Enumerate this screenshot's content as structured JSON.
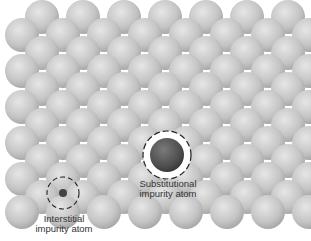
{
  "diagram": {
    "type": "crystal-lattice-point-defects",
    "host_atom_color": "#c9c9c9",
    "impurity_atom_color": "#5a5a5a",
    "background": "#ffffff",
    "rows": [
      {
        "y": 17,
        "x0": 42
      },
      {
        "y": 35,
        "x0": 22
      },
      {
        "y": 53,
        "x0": 42
      },
      {
        "y": 71,
        "x0": 22
      },
      {
        "y": 89,
        "x0": 42
      },
      {
        "y": 107,
        "x0": 22
      },
      {
        "y": 125,
        "x0": 42
      },
      {
        "y": 143,
        "x0": 22
      },
      {
        "y": 161,
        "x0": 42
      },
      {
        "y": 179,
        "x0": 22
      },
      {
        "y": 197,
        "x0": 42
      },
      {
        "y": 212,
        "x0": 22
      }
    ],
    "spacing": 41,
    "atom_radius": 17,
    "substitutional": {
      "x": 167,
      "y": 155,
      "r": 17,
      "ring_r": 24
    },
    "interstitial": {
      "x": 63,
      "y": 193,
      "r": 4,
      "ring_r": 16
    }
  },
  "labels": {
    "substitutional_line1": "Substitutional",
    "substitutional_line2": "impurity atom",
    "interstitial_line1": "Interstitial",
    "interstitial_line2": "impurity atom"
  }
}
